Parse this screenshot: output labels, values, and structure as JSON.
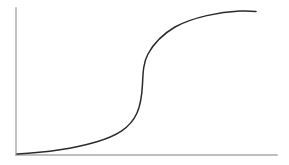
{
  "figure": {
    "background_color": "#ffffff",
    "width": 289,
    "height": 165,
    "title": "",
    "caption": ""
  },
  "axes": {
    "color": "#a8a8a8",
    "line_width": 1.4,
    "y_axis": {
      "name": "y-axis-line",
      "x": 16,
      "y_top": 8,
      "y_bottom": 155
    },
    "x_axis": {
      "name": "x-axis-line",
      "y": 155,
      "x_left": 16,
      "x_right": 277
    },
    "x_tick_labels": [],
    "y_tick_labels": [],
    "grid": false
  },
  "curve": {
    "name": "sigmoid-curve",
    "color": "#2b2b2b",
    "line_width": 1.5,
    "path": "M 17 154 C 45 152.5 72 149 96 142 C 116 136 130 128.5 137 113 C 141 104 142 94 142.5 84 C 143 72 143.5 62 148 54 C 154 43 163 34 175 27 C 193 17 220 12 240 11 C 247 10.8 252 11 256 11.4"
  },
  "chart_data": {
    "type": "line",
    "title": "",
    "subtitle": "",
    "xlabel": "",
    "ylabel": "",
    "xlim": [
      0,
      1
    ],
    "ylim": [
      0,
      1
    ],
    "grid": false,
    "legend": [],
    "annotations": [],
    "series": [
      {
        "name": "sigmoid",
        "color": "#2b2b2b",
        "x": [
          0.0,
          0.05,
          0.1,
          0.15,
          0.2,
          0.25,
          0.3,
          0.35,
          0.4,
          0.45,
          0.48,
          0.5,
          0.52,
          0.55,
          0.6,
          0.65,
          0.7,
          0.75,
          0.8,
          0.85,
          0.9,
          0.95,
          1.0
        ],
        "y": [
          0.0,
          0.01,
          0.02,
          0.03,
          0.05,
          0.07,
          0.09,
          0.12,
          0.17,
          0.26,
          0.35,
          0.48,
          0.61,
          0.7,
          0.78,
          0.84,
          0.88,
          0.91,
          0.93,
          0.95,
          0.96,
          0.97,
          0.975
        ]
      }
    ]
  }
}
